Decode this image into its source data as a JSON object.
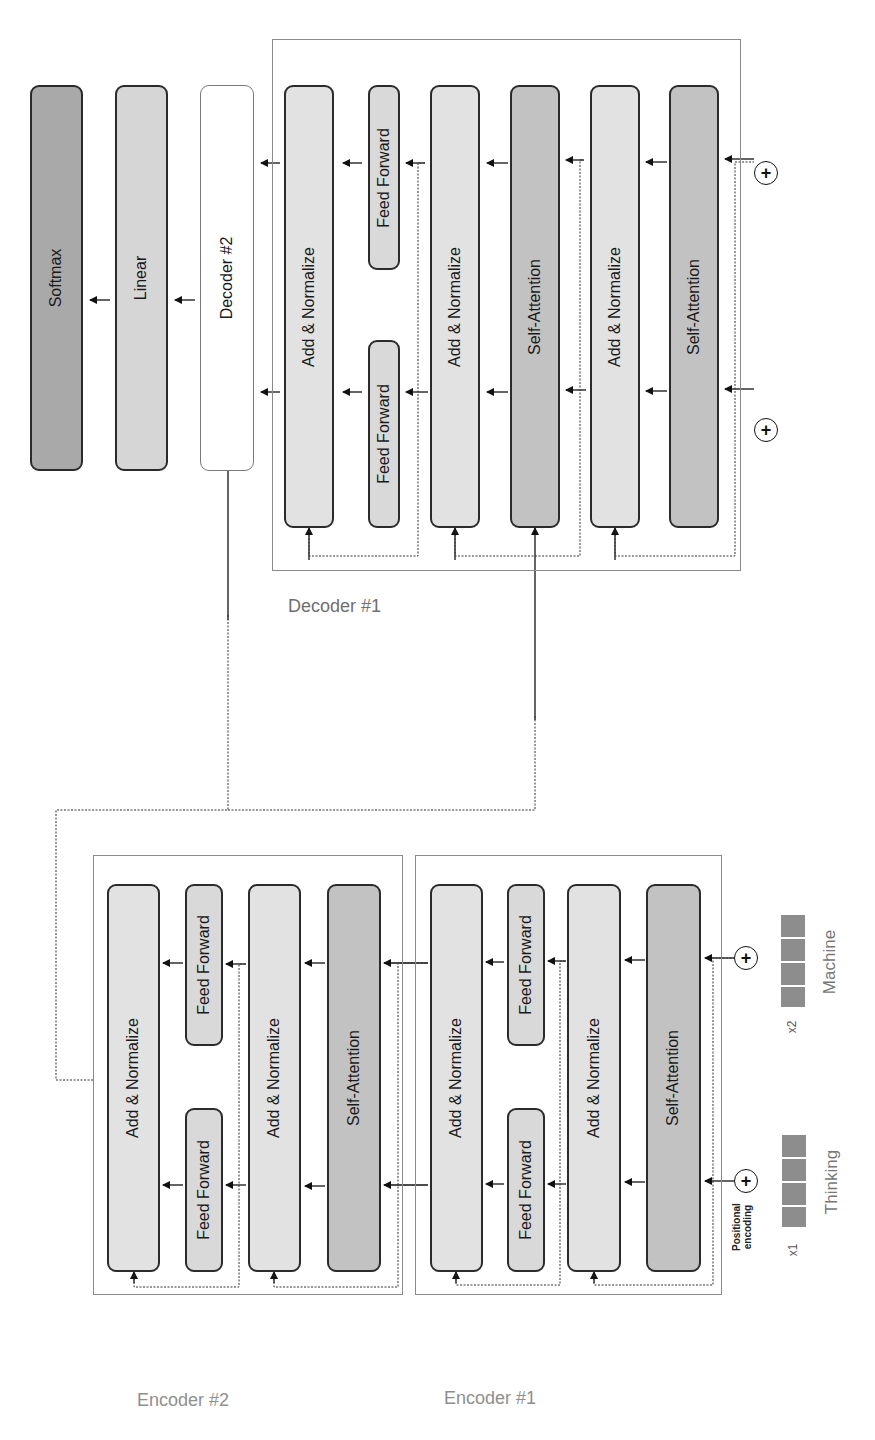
{
  "output_stack": {
    "softmax": "Softmax",
    "linear": "Linear",
    "decoder2": "Decoder #2"
  },
  "decoder1": {
    "label": "Decoder #1",
    "blocks": {
      "add_norm_out": "Add & Normalize",
      "ff_top": "Feed Forward",
      "ff_bottom": "Feed Forward",
      "add_norm_mid": "Add & Normalize",
      "enc_dec_attention": "Self-Attention",
      "add_norm_in": "Add & Normalize",
      "self_attention": "Self-Attention"
    }
  },
  "encoder2": {
    "label": "Encoder #2",
    "blocks": {
      "add_norm_out": "Add & Normalize",
      "ff_top": "Feed Forward",
      "ff_bottom": "Feed Forward",
      "add_norm_in": "Add & Normalize",
      "self_attention": "Self-Attention"
    }
  },
  "encoder1": {
    "label": "Encoder #1",
    "blocks": {
      "add_norm_out": "Add & Normalize",
      "ff_top": "Feed Forward",
      "ff_bottom": "Feed Forward",
      "add_norm_in": "Add & Normalize",
      "self_attention": "Self-Attention"
    }
  },
  "inputs": {
    "positional_encoding_line1": "Positional",
    "positional_encoding_line2": "encoding",
    "tokens": [
      {
        "index": "x1",
        "word": "Thinking"
      },
      {
        "index": "x2",
        "word": "Machine"
      }
    ],
    "plus_symbol": "+"
  },
  "colors": {
    "add_normalize": "#e2e2e2",
    "feed_forward": "#d9d9d9",
    "self_attention": "#c2c2c2",
    "linear": "#d6d6d6",
    "softmax": "#a9a9a9",
    "token_vector": "#8d8d8d",
    "frame": "#8a8a8a"
  }
}
